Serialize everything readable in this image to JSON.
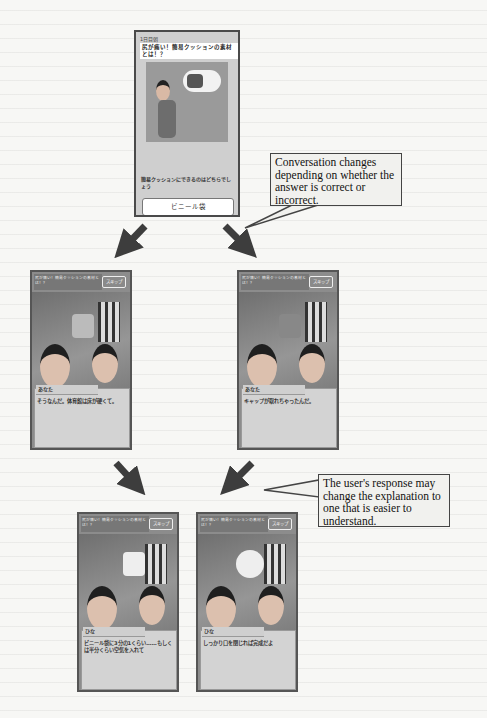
{
  "top_screen": {
    "day_label": "1日目朝",
    "quiz_title": "尻が痛い！簡易クッションの素材とは！？",
    "question": "簡易クッションにできるのはどちらでしょう",
    "answers": [
      "ビニール袋",
      "ペットボトル"
    ]
  },
  "conversation_screens": [
    {
      "header": "尻が痛い！簡易クッションの素材とは！？",
      "skip_label": "スキップ",
      "speaker": "あなた",
      "line": "そうなんだ。体育館は床が硬くて。"
    },
    {
      "header": "尻が痛い！簡易クッションの素材とは！？",
      "skip_label": "スキップ",
      "speaker": "あなた",
      "line": "キャップが取れちゃったんだ。"
    },
    {
      "header": "尻が痛い！簡易クッションの素材とは！？",
      "skip_label": "スキップ",
      "speaker": "ひな",
      "line": "ビニール袋に3分の1くらい……もしくは半分くらい空気を入れて"
    },
    {
      "header": "尻が痛い！簡易クッションの素材とは！？",
      "skip_label": "スキップ",
      "speaker": "ひな",
      "line": "しっかり口を閉じれば完成だよ"
    }
  ],
  "callouts": {
    "branching": "Conversation changes depending on whether the answer is correct or incorrect.",
    "adaptive": "The user's response may change the explanation to one that is easier to understand."
  },
  "colors": {
    "arrow": "#3d3d3d",
    "callout_border": "#444444",
    "callout_fill": "#f1f1ee"
  }
}
